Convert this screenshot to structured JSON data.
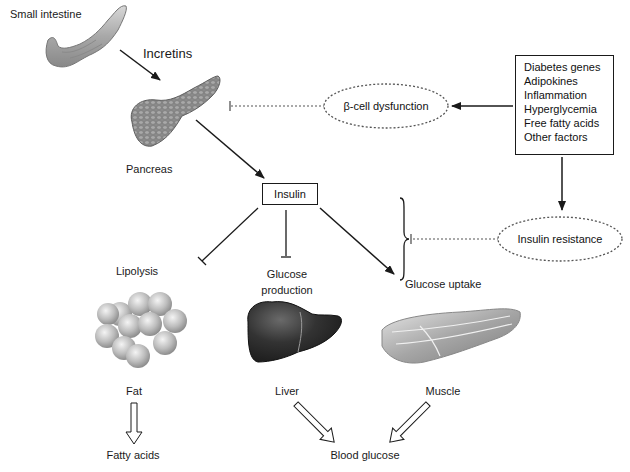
{
  "diagram": {
    "organs": {
      "small_intestine": "Small intestine",
      "pancreas": "Pancreas",
      "fat": "Fat",
      "liver": "Liver",
      "muscle": "Muscle"
    },
    "signals": {
      "incretins": "Incretins",
      "insulin": "Insulin"
    },
    "processes": {
      "lipolysis": "Lipolysis",
      "glucose_production_line1": "Glucose",
      "glucose_production_line2": "production",
      "glucose_uptake": "Glucose uptake"
    },
    "outputs": {
      "fatty_acids": "Fatty acids",
      "blood_glucose": "Blood glucose"
    },
    "dysfunctions": {
      "beta_cell": "β-cell dysfunction",
      "insulin_resistance": "Insulin resistance"
    },
    "factors": [
      "Diabetes genes",
      "Adipokines",
      "Inflammation",
      "Hyperglycemia",
      "Free fatty acids",
      "Other factors"
    ],
    "colors": {
      "line": "#1a1a1a",
      "organ_gray": "#9a9a9a",
      "liver_dark": "#2e2e2e"
    }
  }
}
